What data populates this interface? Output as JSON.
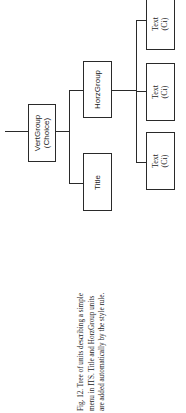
{
  "diagram": {
    "orientation": "rotated-90-ccw",
    "nodes": {
      "root": {
        "line1": "VertGroup",
        "line2": "(Choice)"
      },
      "title": {
        "line1": "Title"
      },
      "horz": {
        "line1": "HorzGroup"
      },
      "text1": {
        "line1": "Text",
        "line2": "(Ci)"
      },
      "text2": {
        "line1": "Text",
        "line2": "(Ci)"
      },
      "text3": {
        "line1": "Text",
        "line2": "(Ci)"
      }
    },
    "edges": [
      [
        "VertGroup (Choice)",
        "HorzGroup"
      ],
      [
        "VertGroup (Choice)",
        "Title"
      ],
      [
        "HorzGroup",
        "Text (Ci)"
      ],
      [
        "HorzGroup",
        "Text (Ci)"
      ],
      [
        "HorzGroup",
        "Text (Ci)"
      ]
    ],
    "line_color": "#2a2a2a"
  },
  "caption": {
    "line1": "Fig. 12.   Tree of units describing a simple",
    "line2": "menu in ITS. Title and HorzGroup units",
    "line3": "are added automatically by the style rule."
  }
}
